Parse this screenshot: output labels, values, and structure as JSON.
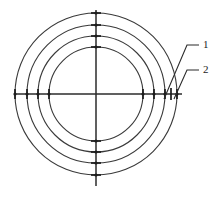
{
  "figure": {
    "type": "engineering-line-drawing",
    "background_color": "#ffffff",
    "line_color": "#3a3a3a",
    "axis_color": "#2b2b2b",
    "tick_color": "#1c1c1c",
    "label_color": "#1c1c1c",
    "center": {
      "x": 96,
      "y": 94
    },
    "rings": [
      {
        "name": "ring-outer",
        "radius": 81
      },
      {
        "name": "ring-second",
        "radius": 69
      },
      {
        "name": "ring-third",
        "radius": 58
      },
      {
        "name": "ring-inner",
        "radius": 47
      }
    ],
    "axes": {
      "horizontal": {
        "x1": 14,
        "y1": 94,
        "x2": 182,
        "y2": 94
      },
      "vertical": {
        "x1": 96,
        "y1": 10,
        "x2": 96,
        "y2": 186
      }
    },
    "tick_half_length": 5,
    "tick_radii": [
      81,
      69,
      58,
      47
    ],
    "tick_directions": [
      "left",
      "right",
      "top",
      "bottom"
    ],
    "extra_right_ticks": [
      {
        "name": "extra-tick-a",
        "x": 169
      },
      {
        "name": "extra-tick-b",
        "x": 175
      }
    ],
    "callouts": [
      {
        "id": "callout-1",
        "label": "1",
        "label_x": 203,
        "label_y": 45,
        "target_x": 165,
        "target_y": 96,
        "elbow_x": 186,
        "elbow_y": 45
      },
      {
        "id": "callout-2",
        "label": "2",
        "label_x": 203,
        "label_y": 70,
        "target_x": 175,
        "target_y": 96,
        "elbow_x": 186,
        "elbow_y": 70
      }
    ]
  }
}
